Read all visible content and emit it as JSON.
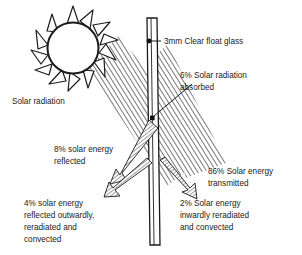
{
  "diagram": {
    "type": "technical-illustration",
    "colors": {
      "ink": "#1c1c1c",
      "hatch": "#5a5a5a",
      "background": "#ffffff"
    },
    "labels": {
      "source": {
        "line1": "Solar radiation"
      },
      "glass": {
        "line1": "3mm Clear float glass"
      },
      "absorbed": {
        "line1": "6% Solar radiation",
        "line2": "absorbed"
      },
      "transmitted": {
        "line1": "86% Solar energy",
        "line2": "transmitted"
      },
      "reflected": {
        "line1": "8% solar energy",
        "line2": "reflected"
      },
      "outward": {
        "line1": "4% solar energy",
        "line2": "reflected outwardly,",
        "line3": "reradiated and",
        "line4": "convected"
      },
      "inward": {
        "line1": "2% Solar energy",
        "line2": "inwardly reradiated",
        "line3": "and convected"
      }
    },
    "values": {
      "absorbed_pct": "6%",
      "transmitted_pct": "86%",
      "reflected_pct": "8%",
      "outward_pct": "4%",
      "inward_pct": "2%",
      "glass_thickness": "3mm"
    }
  }
}
